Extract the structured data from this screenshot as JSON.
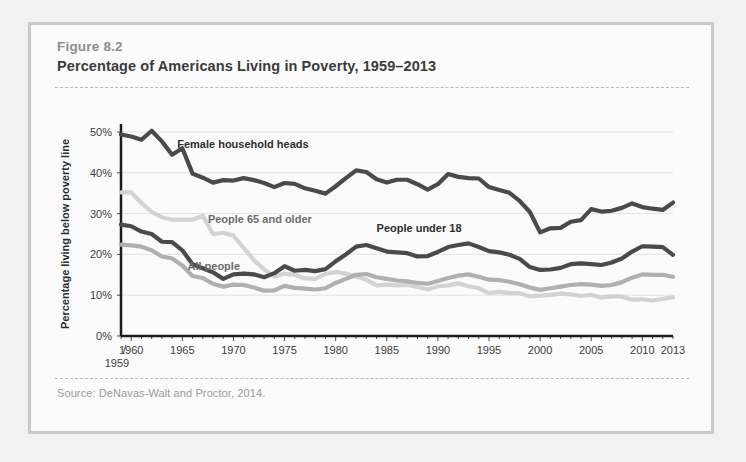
{
  "figure": {
    "number_label": "Figure 8.2",
    "title": "Percentage of Americans Living in Poverty, 1959–2013",
    "source": "Source: DeNavas-Walt and Proctor, 2014."
  },
  "colors": {
    "page_background": "#f2f2f2",
    "panel_background": "#fbfbfb",
    "frame_border": "#c9c9c9",
    "title_text": "#3b3b3b",
    "figure_number_text": "#8d8d8d",
    "source_text": "#9a9a9a",
    "gridline": "#e2e2e2",
    "axis": "#1c1c1c",
    "series_dark": "#4a4a4a",
    "series_medium": "#b0b0b0",
    "series_light": "#d3d3d3"
  },
  "chart_data": {
    "type": "line",
    "title": "Percentage of Americans Living in Poverty, 1959–2013",
    "xlabel": "",
    "ylabel": "Percentage living below poverty line",
    "xlim": [
      1959,
      2013
    ],
    "ylim": [
      0,
      50
    ],
    "grid": true,
    "legend_position": "inline-labels",
    "ytick_labels": [
      "0%",
      "10%",
      "20%",
      "30%",
      "40%",
      "50%"
    ],
    "ytick_values": [
      0,
      10,
      20,
      30,
      40,
      50
    ],
    "xtick_labels": [
      "1960",
      "1965",
      "1970",
      "1975",
      "1980",
      "1985",
      "1990",
      "1995",
      "2000",
      "2005",
      "2010",
      "2013"
    ],
    "xtick_values": [
      1960,
      1965,
      1970,
      1975,
      1980,
      1985,
      1990,
      1995,
      2000,
      2005,
      2010,
      2013
    ],
    "x_origin_label": "1959",
    "x": [
      1959,
      1960,
      1961,
      1962,
      1963,
      1964,
      1965,
      1966,
      1967,
      1968,
      1969,
      1970,
      1971,
      1972,
      1973,
      1974,
      1975,
      1976,
      1977,
      1978,
      1979,
      1980,
      1981,
      1982,
      1983,
      1984,
      1985,
      1986,
      1987,
      1988,
      1989,
      1990,
      1991,
      1992,
      1993,
      1994,
      1995,
      1996,
      1997,
      1998,
      1999,
      2000,
      2001,
      2002,
      2003,
      2004,
      2005,
      2006,
      2007,
      2008,
      2009,
      2010,
      2011,
      2012,
      2013
    ],
    "series": [
      {
        "name": "Female household heads",
        "color": "#4a4a4a",
        "label_position": {
          "x": 1964.5,
          "y": 46.0
        },
        "values": [
          49.4,
          48.9,
          48.1,
          50.3,
          47.7,
          44.4,
          46.0,
          39.8,
          38.8,
          37.6,
          38.2,
          38.1,
          38.7,
          38.2,
          37.5,
          36.5,
          37.5,
          37.3,
          36.2,
          35.6,
          34.9,
          36.7,
          38.7,
          40.6,
          40.2,
          38.4,
          37.6,
          38.3,
          38.3,
          37.2,
          35.9,
          37.2,
          39.7,
          39.0,
          38.7,
          38.6,
          36.5,
          35.8,
          35.1,
          33.1,
          30.4,
          25.4,
          26.4,
          26.5,
          28.0,
          28.4,
          31.1,
          30.5,
          30.7,
          31.4,
          32.5,
          31.6,
          31.2,
          30.9,
          32.7
        ]
      },
      {
        "name": "People 65 and older",
        "color": "#d3d3d3",
        "label_position": {
          "x": 1967.5,
          "y": 27.8
        },
        "values": [
          35.2,
          35.2,
          32.6,
          30.4,
          29.1,
          28.5,
          28.5,
          28.5,
          29.5,
          25.0,
          25.3,
          24.6,
          21.6,
          18.6,
          16.3,
          14.6,
          15.3,
          15.0,
          14.1,
          14.0,
          15.2,
          15.7,
          15.3,
          14.6,
          13.8,
          12.4,
          12.6,
          12.4,
          12.5,
          12.0,
          11.4,
          12.2,
          12.4,
          12.9,
          12.2,
          11.7,
          10.5,
          10.8,
          10.5,
          10.5,
          9.7,
          9.9,
          10.1,
          10.4,
          10.2,
          9.8,
          10.1,
          9.4,
          9.7,
          9.7,
          8.9,
          9.0,
          8.7,
          9.1,
          9.5
        ]
      },
      {
        "name": "People under 18",
        "color": "#4a4a4a",
        "label_position": {
          "x": 1984.0,
          "y": 25.4
        },
        "values": [
          27.3,
          26.9,
          25.6,
          25.0,
          23.1,
          23.0,
          21.0,
          17.6,
          16.6,
          15.6,
          14.0,
          15.1,
          15.3,
          15.1,
          14.4,
          15.4,
          17.1,
          16.0,
          16.2,
          15.9,
          16.4,
          18.3,
          20.0,
          21.9,
          22.3,
          21.5,
          20.7,
          20.5,
          20.3,
          19.5,
          19.6,
          20.6,
          21.8,
          22.3,
          22.7,
          21.8,
          20.8,
          20.5,
          19.9,
          18.9,
          16.9,
          16.2,
          16.3,
          16.7,
          17.6,
          17.8,
          17.6,
          17.4,
          18.0,
          19.0,
          20.7,
          22.0,
          21.9,
          21.8,
          19.9
        ]
      },
      {
        "name": "All people",
        "color": "#b0b0b0",
        "label_position": {
          "x": 1965.5,
          "y": 16.2
        },
        "values": [
          22.4,
          22.2,
          21.9,
          21.0,
          19.5,
          19.0,
          17.3,
          14.7,
          14.2,
          12.8,
          12.1,
          12.6,
          12.5,
          11.9,
          11.1,
          11.2,
          12.3,
          11.8,
          11.6,
          11.4,
          11.7,
          13.0,
          14.0,
          15.0,
          15.2,
          14.4,
          14.0,
          13.6,
          13.4,
          13.0,
          12.8,
          13.5,
          14.2,
          14.8,
          15.1,
          14.5,
          13.8,
          13.7,
          13.3,
          12.7,
          11.9,
          11.3,
          11.7,
          12.1,
          12.5,
          12.7,
          12.6,
          12.3,
          12.5,
          13.2,
          14.3,
          15.1,
          15.0,
          15.0,
          14.5
        ]
      }
    ]
  }
}
